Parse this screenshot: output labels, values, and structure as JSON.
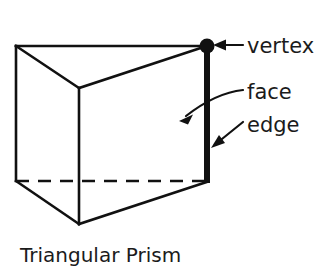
{
  "figure": {
    "caption": "Triangular Prism",
    "background_color": "#ffffff",
    "ink_color": "#111111",
    "annotations": {
      "vertex_label": "vertex",
      "face_label": "face",
      "edge_label": "edge"
    },
    "icons": {
      "vertex_marker": "filled-dot",
      "vertex_pointer": "straight-arrow-left",
      "face_pointer": "curved-arrow-down-left",
      "edge_pointer": "straight-arrow-down-left"
    },
    "shape": {
      "name": "Triangular Prism",
      "solid_type": "triangular prism",
      "visible_vertices": 5,
      "highlighted_vertex_point": "top-right",
      "highlighted_edge": "right vertical edge",
      "hidden_edge_style": "dashed",
      "hidden_edge_description": "back bottom horizontal edge"
    }
  }
}
